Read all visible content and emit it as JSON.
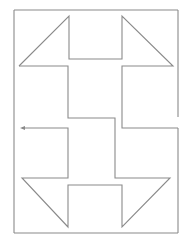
{
  "diagram": {
    "type": "line-drawing",
    "stroke_color": "#8a8a8a",
    "background_color": "#ffffff",
    "frame": {
      "top_segment": "M14,10 L178,10",
      "left_segment": "M14,10 L14,233",
      "bottom_segment": "M14,233 L178,233",
      "right_upper_segment": "M178,10 L178,117",
      "right_lower_segment": "M178,128 L178,233"
    },
    "top_shape": "M19,66 L69,16 L69,59 L122,59 L122,16 L173,66 L122,66 L122,128 L178,128",
    "top_left_leg": "M19,66 L68,66 L68,118 L115,118 L115,178 L170,178 L122,227 L122,185 L68,185 L68,227 L22,178 L68,178 L68,128 L22,128",
    "arrow": {
      "direction": "left",
      "x": 22,
      "y": 128
    }
  }
}
